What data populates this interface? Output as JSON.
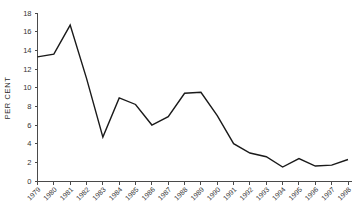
{
  "chart_data": {
    "type": "line",
    "title": "",
    "xlabel": "",
    "ylabel": "PER CENT",
    "categories": [
      "1979",
      "1980",
      "1981",
      "1982",
      "1983",
      "1984",
      "1985",
      "1986",
      "1987",
      "1988",
      "1989",
      "1990",
      "1991",
      "1992",
      "1993",
      "1994",
      "1995",
      "1996",
      "1997",
      "1998"
    ],
    "values": [
      13.3,
      13.6,
      16.7,
      11.0,
      4.7,
      8.9,
      8.2,
      6.0,
      6.9,
      9.4,
      9.5,
      7.0,
      4.0,
      3.0,
      2.6,
      1.5,
      2.4,
      1.6,
      1.7,
      2.3
    ],
    "series": [
      {
        "name": "",
        "values": [
          13.3,
          13.6,
          16.7,
          11.0,
          4.7,
          8.9,
          8.2,
          6.0,
          6.9,
          9.4,
          9.5,
          7.0,
          4.0,
          3.0,
          2.6,
          1.5,
          2.4,
          1.6,
          1.7,
          2.3
        ]
      }
    ],
    "ylim": [
      0,
      18
    ],
    "yticks": [
      0,
      2,
      4,
      6,
      8,
      10,
      12,
      14,
      16,
      18
    ],
    "ytick_labels": [
      "0",
      "2",
      "4",
      "6",
      "8",
      "10",
      "12",
      "14",
      "16",
      "18"
    ],
    "xtick_labels": [
      "1979",
      "1980",
      "1981",
      "1982",
      "1983",
      "1984",
      "1985",
      "1986",
      "1987",
      "1988",
      "1989",
      "1990",
      "1991",
      "1992",
      "1993",
      "1994",
      "1995",
      "1996",
      "1997",
      "1998"
    ],
    "grid": false,
    "legend": null,
    "line_color": "#1a1a1a",
    "axis_color": "#4a4a4a"
  }
}
